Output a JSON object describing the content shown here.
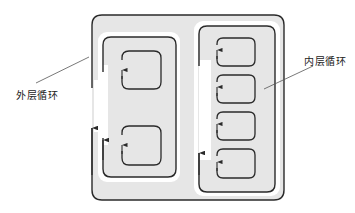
{
  "labels": {
    "outer_loop": "外层循环",
    "inner_loop": "内层循环"
  },
  "colors": {
    "fill": "#e6e6e6",
    "stroke": "#2a2a2a",
    "background": "#ffffff",
    "channel": "#ffffff"
  },
  "structure": {
    "outer_container": {
      "x": 92,
      "y": 15,
      "w": 192,
      "h": 185
    },
    "outer_loop_region": {
      "x": 103,
      "y": 37,
      "w": 73,
      "h": 140
    },
    "inner_loop_region": {
      "x": 198,
      "y": 26,
      "w": 77,
      "h": 166
    },
    "left_blocks": 2,
    "right_blocks": 4
  }
}
